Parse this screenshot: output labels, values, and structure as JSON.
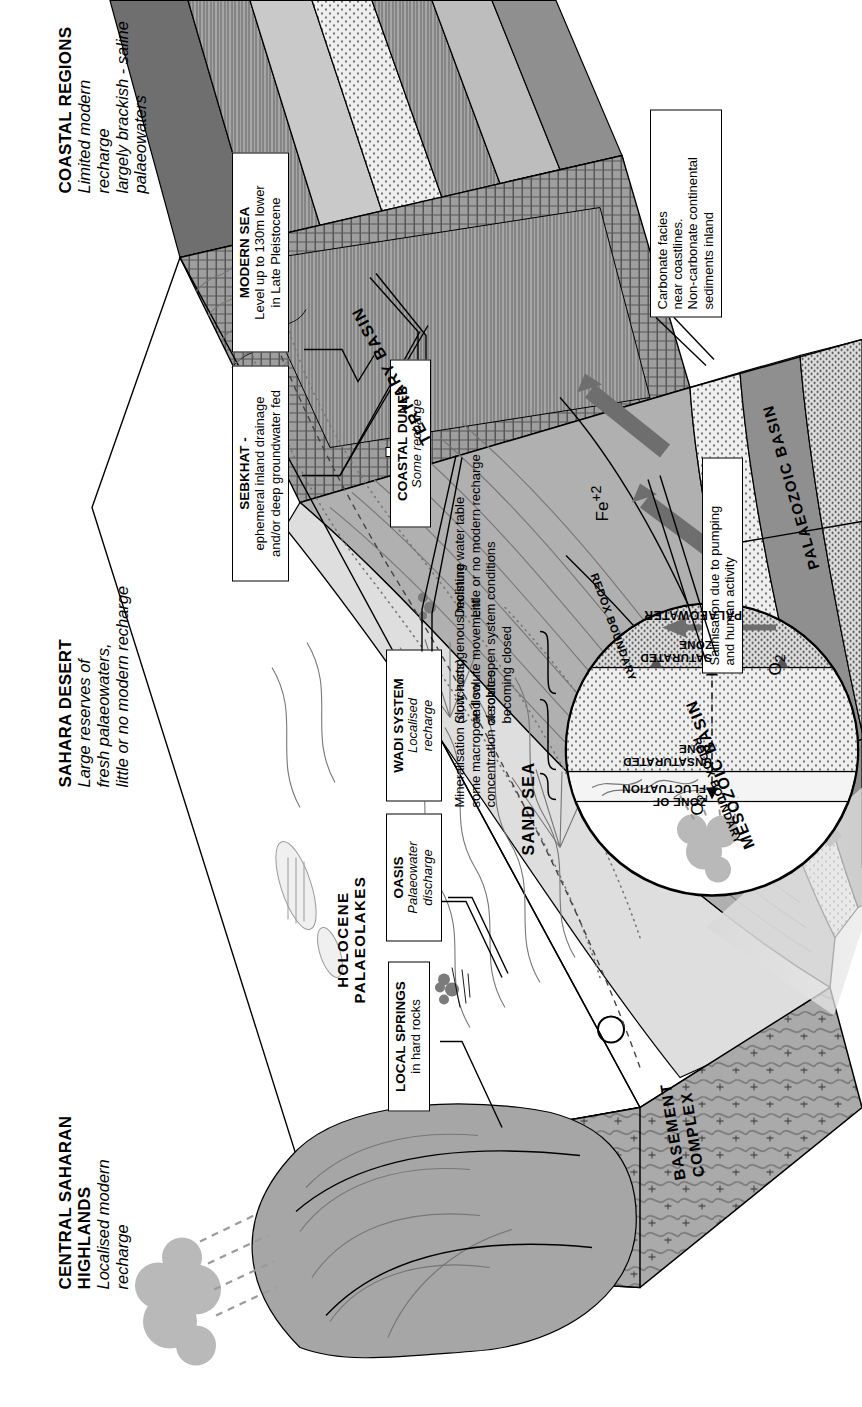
{
  "figure": {
    "type": "geological-block-diagram"
  },
  "headers": [
    {
      "id": "coastal-regions",
      "title": "COASTAL REGIONS",
      "subtitle": "Limited modern recharge\nlargely brackish - saline\npalaeowaters"
    },
    {
      "id": "sahara-desert",
      "title": "SAHARA DESERT",
      "subtitle": "Large reserves of\nfresh palaeowaters,\nlittle or no modern recharge"
    },
    {
      "id": "central-saharan-highlands",
      "title": "CENTRAL SAHARAN\nHIGHLANDS",
      "subtitle": "Localised modern\nrecharge"
    }
  ],
  "callouts": [
    {
      "id": "modern-sea",
      "title": "MODERN SEA",
      "body": "Level up to 130m lower\nin Late Pleistocene",
      "style": "title-body"
    },
    {
      "id": "sebkhat",
      "title": "SEBKHAT -",
      "body": "ephemeral inland drainage\nand/or deep groundwater fed",
      "style": "title-body"
    },
    {
      "id": "coastal-dunes",
      "title": "COASTAL DUNES",
      "body": "Some recharge",
      "style": "title-italic"
    },
    {
      "id": "wadi-system",
      "title": "WADI SYSTEM",
      "body": "Localised\nrecharge",
      "style": "title-italic"
    },
    {
      "id": "oasis",
      "title": "OASIS",
      "body": "Palaeowater\ndischarge",
      "style": "title-italic"
    },
    {
      "id": "local-springs",
      "title": "LOCAL SPRINGS",
      "body": "in hard rocks",
      "style": "title-body"
    },
    {
      "id": "carbonate-facies",
      "title": "",
      "body": "Carbonate facies\nnear coastlines.\nNon-carbonate continental\nsediments inland",
      "style": "plain"
    },
    {
      "id": "salinisation",
      "title": "",
      "body": "Salinisation due to pumping\nand human activity",
      "style": "plain"
    }
  ],
  "map_labels": [
    {
      "id": "sand-sea",
      "text": "SAND SEA"
    },
    {
      "id": "holocene-palaeolakes",
      "text": "HOLOCENE\nPALAEOLAKES"
    },
    {
      "id": "basement-complex",
      "text": "BASEMENT\nCOMPLEX"
    },
    {
      "id": "tertiary-basin",
      "text": "TERTIARY  BASIN"
    },
    {
      "id": "mesozoic-basin",
      "text": "MESOZOIC  BASIN"
    },
    {
      "id": "palaeozoic-basin",
      "text": "PALAEOZOIC  BASIN"
    },
    {
      "id": "redox-boundary-upper",
      "text": "REDOX BOUNDARY"
    },
    {
      "id": "redox-boundary-lower",
      "text": "REDOX BOUNDARY"
    },
    {
      "id": "oxygen-upper",
      "text": "O2"
    },
    {
      "id": "oxygen-lower",
      "text": "O2"
    },
    {
      "id": "iron",
      "text": "Fe+2"
    }
  ],
  "inset": {
    "id": "soil-profile-inset",
    "zones": [
      {
        "id": "zone-of-fluctuation",
        "label": "ZONE OF\nFLUCTUATION"
      },
      {
        "id": "unsaturated-zone",
        "label": "UNSATURATED\nZONE"
      },
      {
        "id": "saturated-zone",
        "label": "SATURATED\nZONE"
      },
      {
        "id": "palaeowater",
        "label": "PALAEOWATER"
      }
    ],
    "annotations": [
      "Mineralisation (duricrusts)\nsome macropore flow\nconcentration of solutes",
      "Slow homogenous moisture\nand solute movement\naerobic open system conditions\nbecoming closed",
      "Declining water table\nLittle or no modern recharge"
    ]
  },
  "colors": {
    "ink": "#000000",
    "basin_dark": "#8e8e8e",
    "basin_mid": "#b5b5b5",
    "basin_light": "#dcdcdc",
    "sand": "#efefef",
    "arrow": "#6e6e6e"
  }
}
